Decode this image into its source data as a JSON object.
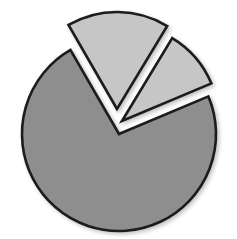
{
  "chart_data": {
    "type": "pie",
    "title": "",
    "labels": [
      "",
      "",
      ""
    ],
    "values": [
      73,
      17,
      10
    ],
    "exploded": [
      false,
      true,
      true
    ],
    "legend": "none",
    "colors": [
      "#8e8e8e",
      "#c6c6c6",
      "#c6c6c6"
    ],
    "stroke": "#1c1c1c"
  },
  "geometry": {
    "cx": 119,
    "cy": 134,
    "r": 97,
    "start_angle_deg": -120,
    "explode_offsets": [
      [
        0,
        0
      ],
      [
        -2,
        -25
      ],
      [
        3,
        -13
      ]
    ]
  }
}
